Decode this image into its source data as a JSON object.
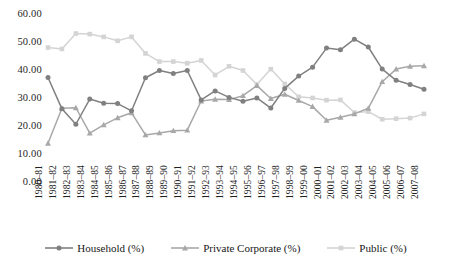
{
  "chart_data": {
    "type": "line",
    "title": "",
    "subtitle": "",
    "xlabel": "",
    "ylabel": "",
    "ylim": [
      0,
      60
    ],
    "yticks": [
      "0.00",
      "10.00",
      "20.00",
      "30.00",
      "40.00",
      "50.00",
      "60.00"
    ],
    "ytick_values": [
      0,
      10,
      20,
      30,
      40,
      50,
      60
    ],
    "grid": false,
    "legend_position": "bottom",
    "categories": [
      "1980–81",
      "1981–82",
      "1982–83",
      "1983–84",
      "1984–85",
      "1985–86",
      "1986–87",
      "1987–88",
      "1988–89",
      "1989–90",
      "1990–91",
      "1991–92",
      "1992–93",
      "1993–94",
      "1994–95",
      "1995–96",
      "1996–97",
      "1997–98",
      "1998–99",
      "1999–00",
      "2000–01",
      "2001–02",
      "2002–03",
      "2003–04",
      "2004–05",
      "2005–06",
      "2006–07",
      "2007–08"
    ],
    "series": [
      {
        "name": "Household (%)",
        "color": "#808080",
        "marker": "circle",
        "values": [
          37.5,
          26.3,
          20.8,
          29.8,
          28.3,
          28.2,
          25.6,
          37.4,
          40.0,
          38.9,
          40.0,
          29.5,
          32.7,
          30.4,
          29.0,
          30.2,
          26.6,
          33.6,
          38.0,
          41.2,
          48.0,
          47.4,
          51.2,
          48.4,
          40.5,
          36.5,
          35.0,
          33.3
        ]
      },
      {
        "name": "Private Corporate (%)",
        "color": "#a8a8a8",
        "marker": "triangle",
        "values": [
          14.0,
          26.5,
          26.7,
          17.6,
          20.6,
          23.1,
          24.9,
          17.0,
          17.7,
          18.5,
          18.7,
          29.1,
          29.7,
          29.6,
          31.0,
          34.6,
          30.0,
          31.5,
          29.3,
          27.1,
          22.2,
          23.3,
          24.5,
          26.5,
          36.0,
          40.5,
          41.5,
          41.7
        ]
      },
      {
        "name": "Public (%)",
        "color": "#d4d4d4",
        "marker": "square",
        "values": [
          48.2,
          47.7,
          53.2,
          53.0,
          52.0,
          50.6,
          52.0,
          46.1,
          43.2,
          43.2,
          42.6,
          43.6,
          38.4,
          41.5,
          40.0,
          35.0,
          40.5,
          35.2,
          30.6,
          30.2,
          29.4,
          29.5,
          25.0,
          25.3,
          22.6,
          22.8,
          23.0,
          24.5
        ]
      }
    ]
  },
  "legend": {
    "items": [
      {
        "label": "Household (%)",
        "color": "#808080",
        "marker": "circle"
      },
      {
        "label": "Private Corporate (%)",
        "color": "#a8a8a8",
        "marker": "triangle"
      },
      {
        "label": "Public (%)",
        "color": "#d4d4d4",
        "marker": "square"
      }
    ]
  }
}
